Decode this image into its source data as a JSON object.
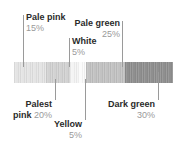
{
  "chart_data": {
    "type": "bar",
    "title": "",
    "subtitle": "",
    "xlabel": "",
    "ylabel": "",
    "orientation": "horizontal-stacked",
    "grid": false,
    "legend_position": "callout-labels",
    "categories": [
      "Palest pink",
      "Pale pink",
      "Yellow",
      "White",
      "Pale green",
      "Dark green"
    ],
    "values": [
      20,
      15,
      5,
      5,
      25,
      30
    ],
    "unit": "%",
    "total": 100,
    "colors": [
      "#e4e4e4",
      "#d2d2d2",
      "#f4f4f4",
      "#fbfbfb",
      "#c2c2c2",
      "#8f8f8f"
    ],
    "segments": [
      {
        "name": "Palest pink",
        "percent_label": "20%",
        "value": 20,
        "color": "#e4e4e4"
      },
      {
        "name": "Pale pink",
        "percent_label": "15%",
        "value": 15,
        "color": "#d2d2d2"
      },
      {
        "name": "Yellow",
        "percent_label": "5%",
        "value": 5,
        "color": "#f4f4f4"
      },
      {
        "name": "White",
        "percent_label": "5%",
        "value": 5,
        "color": "#fbfbfb"
      },
      {
        "name": "Pale green",
        "percent_label": "25%",
        "value": 25,
        "color": "#c2c2c2"
      },
      {
        "name": "Dark green",
        "percent_label": "30%",
        "value": 30,
        "color": "#8f8f8f"
      }
    ]
  },
  "callouts": {
    "pale_pink": {
      "name": "Pale pink",
      "percent": "15%"
    },
    "pale_green": {
      "name": "Pale green",
      "percent": "25%"
    },
    "white": {
      "name": "White",
      "percent": "5%"
    },
    "palest_pink": {
      "name_line1": "Palest",
      "name_line2": "pink",
      "percent": "20%"
    },
    "yellow": {
      "name": "Yellow",
      "percent": "5%"
    },
    "dark_green": {
      "name": "Dark green",
      "percent": "30%"
    }
  },
  "style": {
    "text_color": "#2b2b2b",
    "muted_color": "#9a9a9a",
    "leader_color": "#9a9a9a",
    "background": "#ffffff"
  }
}
